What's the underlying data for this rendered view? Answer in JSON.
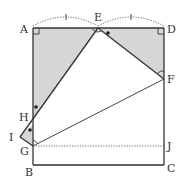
{
  "diagram": {
    "type": "geometry-figure",
    "points": {
      "A": "A",
      "B": "B",
      "C": "C",
      "D": "D",
      "E": "E",
      "F": "F",
      "G": "G",
      "H": "H",
      "I": "I",
      "J": "J"
    },
    "marks": {
      "equal_tick_AE": "AE",
      "equal_tick_ED": "ED",
      "right_angle_A": "A",
      "right_angle_D": "D",
      "angle_arc_E": "E",
      "angle_arc_F": "F",
      "angle_arc_I": "I",
      "dot_angle_E": "E",
      "dot_angle_H": "H",
      "dot_angle_G": "G"
    },
    "segments": [
      "AB",
      "BC",
      "CD",
      "DA",
      "EF",
      "EH",
      "HI",
      "IG",
      "GF",
      "GJ(dotted)"
    ],
    "shaded_regions": [
      "triangle AEH",
      "triangle EDF"
    ],
    "colors": {
      "line": "#333333",
      "shade": "#d6d6d6"
    }
  }
}
